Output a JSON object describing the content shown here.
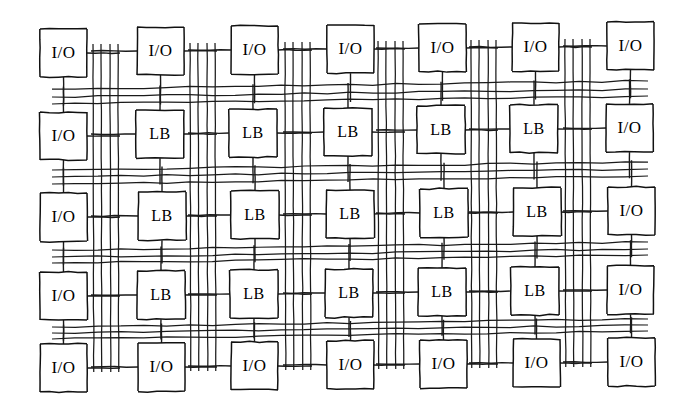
{
  "diagram": {
    "type": "fpga-architecture-grid",
    "style": "hand-drawn scanned line art",
    "background_color": "#ffffff",
    "line_color": "#1a1a1a",
    "block_fill": "#ffffff",
    "block_stroke": "#111111",
    "grid": {
      "columns": 7,
      "rows": 5,
      "interior_logic_columns": 5,
      "interior_logic_rows": 3
    },
    "routing": {
      "vertical_wires_per_channel": 4,
      "horizontal_wires_per_channel": 3,
      "vertical_channel_count": 6,
      "horizontal_channel_count": 4
    },
    "labels": {
      "io": "I/O",
      "logic": "LB"
    },
    "legend_note": "I/O = input/output block, LB = logic block",
    "blocks": [
      {
        "row": 0,
        "col": 0,
        "kind": "io",
        "label": "I/O",
        "x": 40,
        "y": 29,
        "w": 47,
        "h": 48
      },
      {
        "row": 0,
        "col": 1,
        "kind": "io",
        "label": "I/O",
        "x": 137,
        "y": 27,
        "w": 47,
        "h": 48
      },
      {
        "row": 0,
        "col": 2,
        "kind": "io",
        "label": "I/O",
        "x": 231,
        "y": 26,
        "w": 47,
        "h": 48
      },
      {
        "row": 0,
        "col": 3,
        "kind": "io",
        "label": "I/O",
        "x": 327,
        "y": 25,
        "w": 47,
        "h": 48
      },
      {
        "row": 0,
        "col": 4,
        "kind": "io",
        "label": "I/O",
        "x": 419,
        "y": 24,
        "w": 47,
        "h": 48
      },
      {
        "row": 0,
        "col": 5,
        "kind": "io",
        "label": "I/O",
        "x": 512,
        "y": 23,
        "w": 47,
        "h": 48
      },
      {
        "row": 0,
        "col": 6,
        "kind": "io",
        "label": "I/O",
        "x": 607,
        "y": 22,
        "w": 47,
        "h": 48
      },
      {
        "row": 1,
        "col": 0,
        "kind": "io",
        "label": "I/O",
        "x": 40,
        "y": 112,
        "w": 47,
        "h": 48
      },
      {
        "row": 1,
        "col": 1,
        "kind": "logic",
        "label": "LB",
        "x": 136,
        "y": 110,
        "w": 48,
        "h": 48
      },
      {
        "row": 1,
        "col": 2,
        "kind": "logic",
        "label": "LB",
        "x": 229,
        "y": 109,
        "w": 48,
        "h": 48
      },
      {
        "row": 1,
        "col": 3,
        "kind": "logic",
        "label": "LB",
        "x": 324,
        "y": 108,
        "w": 48,
        "h": 48
      },
      {
        "row": 1,
        "col": 4,
        "kind": "logic",
        "label": "LB",
        "x": 417,
        "y": 106,
        "w": 48,
        "h": 48
      },
      {
        "row": 1,
        "col": 5,
        "kind": "logic",
        "label": "LB",
        "x": 510,
        "y": 105,
        "w": 48,
        "h": 48
      },
      {
        "row": 1,
        "col": 6,
        "kind": "io",
        "label": "I/O",
        "x": 606,
        "y": 104,
        "w": 47,
        "h": 48
      },
      {
        "row": 2,
        "col": 0,
        "kind": "io",
        "label": "I/O",
        "x": 40,
        "y": 193,
        "w": 47,
        "h": 48
      },
      {
        "row": 2,
        "col": 1,
        "kind": "logic",
        "label": "LB",
        "x": 138,
        "y": 192,
        "w": 48,
        "h": 48
      },
      {
        "row": 2,
        "col": 2,
        "kind": "logic",
        "label": "LB",
        "x": 231,
        "y": 191,
        "w": 48,
        "h": 48
      },
      {
        "row": 2,
        "col": 3,
        "kind": "logic",
        "label": "LB",
        "x": 326,
        "y": 190,
        "w": 48,
        "h": 48
      },
      {
        "row": 2,
        "col": 4,
        "kind": "logic",
        "label": "LB",
        "x": 420,
        "y": 189,
        "w": 48,
        "h": 48
      },
      {
        "row": 2,
        "col": 5,
        "kind": "logic",
        "label": "LB",
        "x": 513,
        "y": 188,
        "w": 48,
        "h": 48
      },
      {
        "row": 2,
        "col": 6,
        "kind": "io",
        "label": "I/O",
        "x": 608,
        "y": 187,
        "w": 47,
        "h": 48
      },
      {
        "row": 3,
        "col": 0,
        "kind": "io",
        "label": "I/O",
        "x": 40,
        "y": 272,
        "w": 47,
        "h": 48
      },
      {
        "row": 3,
        "col": 1,
        "kind": "logic",
        "label": "LB",
        "x": 137,
        "y": 271,
        "w": 48,
        "h": 48
      },
      {
        "row": 3,
        "col": 2,
        "kind": "logic",
        "label": "LB",
        "x": 230,
        "y": 270,
        "w": 48,
        "h": 48
      },
      {
        "row": 3,
        "col": 3,
        "kind": "logic",
        "label": "LB",
        "x": 325,
        "y": 269,
        "w": 48,
        "h": 48
      },
      {
        "row": 3,
        "col": 4,
        "kind": "logic",
        "label": "LB",
        "x": 418,
        "y": 268,
        "w": 48,
        "h": 48
      },
      {
        "row": 3,
        "col": 5,
        "kind": "logic",
        "label": "LB",
        "x": 511,
        "y": 267,
        "w": 48,
        "h": 48
      },
      {
        "row": 3,
        "col": 6,
        "kind": "io",
        "label": "I/O",
        "x": 607,
        "y": 266,
        "w": 47,
        "h": 48
      },
      {
        "row": 4,
        "col": 0,
        "kind": "io",
        "label": "I/O",
        "x": 40,
        "y": 344,
        "w": 47,
        "h": 48
      },
      {
        "row": 4,
        "col": 1,
        "kind": "io",
        "label": "I/O",
        "x": 138,
        "y": 343,
        "w": 47,
        "h": 48
      },
      {
        "row": 4,
        "col": 2,
        "kind": "io",
        "label": "I/O",
        "x": 231,
        "y": 342,
        "w": 47,
        "h": 48
      },
      {
        "row": 4,
        "col": 3,
        "kind": "io",
        "label": "I/O",
        "x": 327,
        "y": 341,
        "w": 47,
        "h": 48
      },
      {
        "row": 4,
        "col": 4,
        "kind": "io",
        "label": "I/O",
        "x": 420,
        "y": 340,
        "w": 47,
        "h": 48
      },
      {
        "row": 4,
        "col": 5,
        "kind": "io",
        "label": "I/O",
        "x": 513,
        "y": 339,
        "w": 47,
        "h": 48
      },
      {
        "row": 4,
        "col": 6,
        "kind": "io",
        "label": "I/O",
        "x": 608,
        "y": 338,
        "w": 47,
        "h": 48
      }
    ],
    "vertical_channels": [
      {
        "index": 0,
        "wire_x": [
          93,
          101,
          110,
          118
        ],
        "y_top": 44,
        "y_bottom": 372,
        "skew": 5
      },
      {
        "index": 1,
        "wire_x": [
          190,
          198,
          207,
          215
        ],
        "y_top": 43,
        "y_bottom": 371,
        "skew": 5
      },
      {
        "index": 2,
        "wire_x": [
          285,
          293,
          302,
          310
        ],
        "y_top": 42,
        "y_bottom": 370,
        "skew": 5
      },
      {
        "index": 3,
        "wire_x": [
          378,
          386,
          395,
          403
        ],
        "y_top": 41,
        "y_bottom": 369,
        "skew": 5
      },
      {
        "index": 4,
        "wire_x": [
          471,
          479,
          488,
          496
        ],
        "y_top": 40,
        "y_bottom": 368,
        "skew": 5
      },
      {
        "index": 5,
        "wire_x": [
          565,
          573,
          582,
          590
        ],
        "y_top": 39,
        "y_bottom": 367,
        "skew": 5
      }
    ],
    "horizontal_channels": [
      {
        "index": 0,
        "wire_y": [
          89,
          97,
          104
        ],
        "x_left": 52,
        "x_right": 648,
        "skew": -8
      },
      {
        "index": 1,
        "wire_y": [
          170,
          177,
          184
        ],
        "x_left": 52,
        "x_right": 648,
        "skew": -8
      },
      {
        "index": 2,
        "wire_y": [
          250,
          257,
          263
        ],
        "x_left": 52,
        "x_right": 648,
        "skew": -8
      },
      {
        "index": 3,
        "wire_y": [
          327,
          333,
          339
        ],
        "x_left": 52,
        "x_right": 648,
        "skew": -8
      }
    ]
  }
}
